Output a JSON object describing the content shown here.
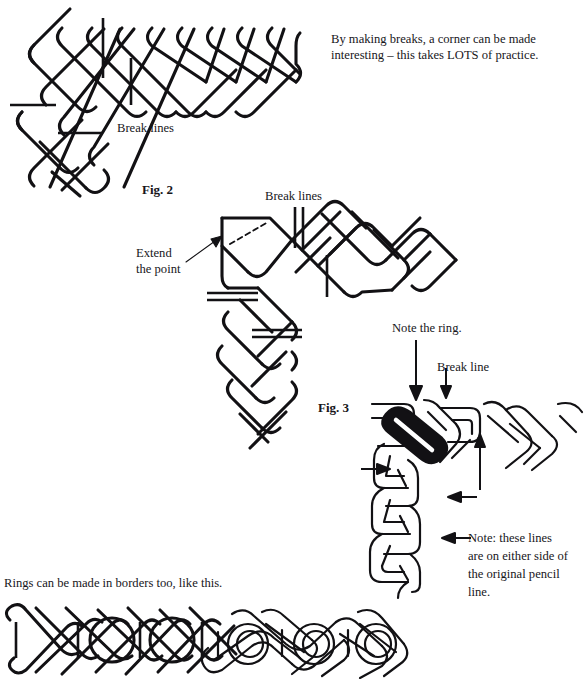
{
  "page": {
    "width": 588,
    "height": 679,
    "background_color": "#ffffff",
    "ink_color": "#121114"
  },
  "figures": {
    "fig1": {
      "label": "",
      "caption_top_cut": "",
      "type": "grid-lattice-corner",
      "description": "Open diagonal lattice forming a right-angle corner, with break lines marked"
    },
    "fig2": {
      "label": "Fig. 2",
      "type": "grid-lattice-corner-with-extended-point"
    },
    "fig3": {
      "label": "Fig. 3",
      "type": "finished-interlace-corner-with-ring"
    }
  },
  "annotations": {
    "intro_line1": "By making breaks, a corner can be made",
    "intro_line2": "interesting – this takes LOTS of practice.",
    "break_lines_fig1": "Break lines",
    "break_lines_fig2": "Break lines",
    "extend_line1": "Extend",
    "extend_line2": "the point",
    "note_the_ring": "Note the ring.",
    "break_line_fig3": "Break line",
    "note_line1": "Note: these lines",
    "note_line2": "are on either side of",
    "note_line3": "the original pencil",
    "note_line4": "line.",
    "border_caption": "Rings can be made in borders too, like this."
  },
  "border_strip": {
    "caption": "Rings can be made in borders too, like this.",
    "description": "Horizontal band: left portion is an open grid lattice with tick break-marks and two plain rings; right portion is the finished interlaced knot with rings."
  }
}
